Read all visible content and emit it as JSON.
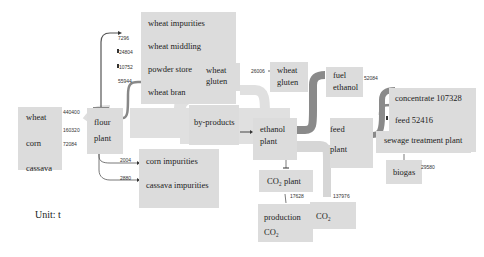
{
  "diagram": {
    "type": "sankey-material-flow",
    "unit_label": "Unit: t",
    "nodes": {
      "inputs": [
        "wheat",
        "corn",
        "cassava"
      ],
      "flour_plant": [
        "flour",
        "plant"
      ],
      "wheat_outputs": [
        "wheat impurities",
        "wheat middling",
        "powder store",
        "wheat bran"
      ],
      "wheat_gluten_mid": [
        "wheat",
        "gluten"
      ],
      "wheat_gluten_right": [
        "wheat",
        "gluten"
      ],
      "by_products": "by-products",
      "corn_impurities": "corn impurities",
      "cassava_impurities": "cassava impurities",
      "ethanol_plant": [
        "ethanol",
        "plant"
      ],
      "fuel_ethanol": [
        "fuel",
        "ethanol"
      ],
      "feed_plant": [
        "feed",
        "plant"
      ],
      "concentrate": "concentrate 107328",
      "feed": "feed 52416",
      "sewage_plant": "sewage treatment plant",
      "biogas": "biogas",
      "co2_plant": "CO₂ plant",
      "production_co2": [
        "production",
        "CO₂"
      ],
      "co2": "CO₂"
    },
    "flows": {
      "wheat_in": "440400",
      "corn_in": "160320",
      "cassava_in": "72084",
      "wheat_impurities": "7296",
      "wheat_middling": "24804",
      "powder_store": "10752",
      "wheat_bran": "55944",
      "corn_impurities": "2004",
      "cassava_impurities": "2880",
      "wheat_gluten": "26006",
      "fuel_ethanol": "52084",
      "production_co2": "17628",
      "co2": "137976",
      "biogas": "29580"
    },
    "colors": {
      "box": "#dcdcdc",
      "flow_light": "#d6d6d6",
      "flow_dark": "#8a8a8a",
      "arrow": "#555555"
    }
  }
}
